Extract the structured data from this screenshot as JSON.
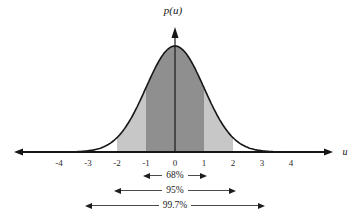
{
  "chart_data": {
    "type": "area",
    "curve": "standard-normal-pdf",
    "xlabel": "u",
    "ylabel": "p(u)",
    "x_ticks": [
      -4,
      -3,
      -2,
      -1,
      0,
      1,
      2,
      3,
      4
    ],
    "xlim": [
      -4.7,
      4.7
    ],
    "grid": false,
    "colors": {
      "sigma1_fill": "#8f8f8f",
      "sigma2_fill": "#c7c7c7",
      "curve_stroke": "#161616",
      "axis_stroke": "#161616"
    },
    "regions": [
      {
        "name": "within-1-sigma",
        "range": [
          -1,
          1
        ],
        "color": "#8f8f8f"
      },
      {
        "name": "1-to-2-sigma-left",
        "range": [
          -2,
          -1
        ],
        "color": "#c7c7c7"
      },
      {
        "name": "1-to-2-sigma-right",
        "range": [
          1,
          2
        ],
        "color": "#c7c7c7"
      }
    ],
    "annotations": [
      {
        "label": "68%",
        "span": [
          -1,
          1
        ]
      },
      {
        "label": "95%",
        "span": [
          -2,
          2
        ]
      },
      {
        "label": "99.7%",
        "span": [
          -3,
          3
        ]
      }
    ]
  }
}
